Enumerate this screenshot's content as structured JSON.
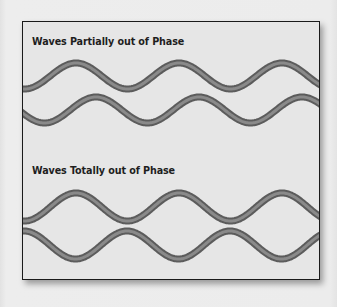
{
  "diagram": {
    "sections": [
      {
        "title": "Waves Partially out of Phase",
        "waves": [
          {
            "name": "wave-a",
            "baseline_y": 54,
            "amplitude": 13,
            "period": 103,
            "phase_peak_x": 53
          },
          {
            "name": "wave-b",
            "baseline_y": 88,
            "amplitude": 13,
            "period": 103,
            "phase_peak_x": 73
          }
        ]
      },
      {
        "title": "Waves Totally out of Phase",
        "waves": [
          {
            "name": "wave-c",
            "baseline_y": 185,
            "amplitude": 14,
            "period": 103,
            "phase_peak_x": 53
          },
          {
            "name": "wave-d",
            "baseline_y": 223,
            "amplitude": 14,
            "period": 103,
            "phase_peak_x": 104
          }
        ]
      }
    ],
    "colors": {
      "background": "#ececec",
      "panel": "#e6e6e6",
      "border": "#1a1a1a",
      "wave_edge": "#5c5c5c",
      "wave_core": "#8a8a8a",
      "title_text": "#1e1e1e"
    }
  }
}
